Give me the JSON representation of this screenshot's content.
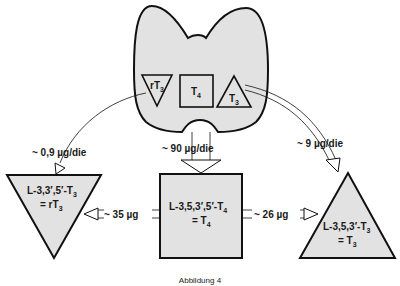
{
  "gland": {
    "inner": [
      {
        "name": "rT",
        "sub": "3"
      },
      {
        "name": "T",
        "sub": "4"
      },
      {
        "name": "T",
        "sub": "3"
      }
    ]
  },
  "flows": {
    "to_rT3": "~ 0,9 µg/die",
    "to_T4": "~ 90 µg/die",
    "to_T3": "~ 9 µg/die",
    "T4_to_rT3": "~ 35 µg",
    "T4_to_T3": "~ 26 µg"
  },
  "nodes": {
    "rT3": {
      "line1": "L-3,3′,5′-T",
      "line1_sub": "3",
      "line2": "= rT",
      "line2_sub": "3"
    },
    "T4": {
      "line1": "L-3,5,3′,5′-T",
      "line1_sub": "4",
      "line2": "= T",
      "line2_sub": "4"
    },
    "T3": {
      "line1": "L-3,5,3′-T",
      "line1_sub": "3",
      "line2": "= T",
      "line2_sub": "3"
    }
  },
  "caption": "Abbildung 4",
  "colors": {
    "fill": "#e2e2e2",
    "stroke": "#111111"
  }
}
